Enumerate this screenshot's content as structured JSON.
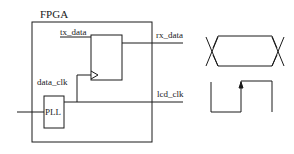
{
  "diagram": {
    "fpga_label": "FPGA",
    "signals": {
      "tx_data": "tx_data",
      "rx_data": "rx_data",
      "data_clk": "data_clk",
      "lcd_clk": "lcd_clk"
    },
    "blocks": {
      "pll": "PLL",
      "flip_flop": ""
    },
    "waveforms": [
      "data-eye",
      "clock-rising-edge"
    ],
    "colors": {
      "stroke": "#1a1a1a",
      "background": "#ffffff"
    }
  }
}
